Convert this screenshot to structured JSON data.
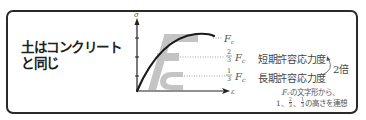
{
  "headline": {
    "line1": "土はコンクリート",
    "line2": "と同じ"
  },
  "diagram": {
    "y_axis_label": "σ",
    "x_axis_label": "ε",
    "levels": [
      {
        "fraction_num": "",
        "fraction_den": "",
        "symbol": "F",
        "subscript": "c",
        "value": 1,
        "label": ""
      },
      {
        "fraction_num": "2",
        "fraction_den": "3",
        "symbol": "F",
        "subscript": "c",
        "value": 0.6667,
        "label": "短期許容応力度"
      },
      {
        "fraction_num": "1",
        "fraction_den": "3",
        "symbol": "F",
        "subscript": "c",
        "value": 0.3333,
        "label": "長期許容応力度"
      }
    ],
    "ratio_label": "2倍",
    "watermark_letters": "Fc",
    "note_line1_symbol": "F",
    "note_line1_sub": "c",
    "note_line1_text": "の文字形から、",
    "note_line2_prefix": "1、",
    "note_line2_f1_num": "2",
    "note_line2_f1_den": "3",
    "note_line2_sep": "、",
    "note_line2_f2_num": "1",
    "note_line2_f2_den": "3",
    "note_line2_text": "の高さを連想"
  },
  "colors": {
    "frame": "#2a2a2a",
    "curve": "#1a1a1a",
    "watermark": "#bdbdbd",
    "text": "#444444"
  }
}
